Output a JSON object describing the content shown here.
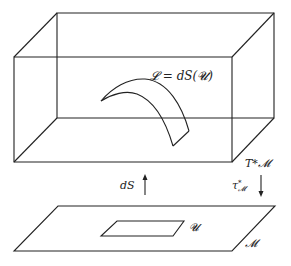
{
  "diagram": {
    "top_box": {
      "label": "T*𝓜",
      "front_face": [
        [
          14,
          57
        ],
        [
          232,
          57
        ],
        [
          232,
          162
        ],
        [
          14,
          162
        ]
      ],
      "back_face": [
        [
          57,
          13
        ],
        [
          274,
          13
        ],
        [
          274,
          118
        ],
        [
          57,
          118
        ]
      ]
    },
    "lagrangian_surface": {
      "label": "𝓛 = dS(𝓤)"
    },
    "arrows": {
      "section": {
        "label": "dS",
        "direction": "up"
      },
      "projection": {
        "label": "τ",
        "superscript": "*",
        "subscript": "𝓜",
        "direction": "down"
      }
    },
    "base_plane": {
      "label": "𝓜",
      "corners": [
        [
          58,
          206
        ],
        [
          275,
          206
        ],
        [
          232,
          251
        ],
        [
          14,
          251
        ]
      ]
    },
    "open_set": {
      "label": "𝓤",
      "corners": [
        [
          117,
          221
        ],
        [
          184,
          221
        ],
        [
          173,
          236
        ],
        [
          101,
          236
        ]
      ]
    }
  }
}
